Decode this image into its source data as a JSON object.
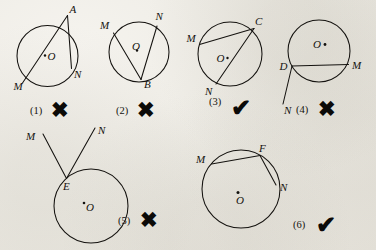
{
  "page": {
    "background_color": "#efece6",
    "ink_color": "#14120f",
    "figure_count": 6,
    "rows": 2
  },
  "marks": {
    "cross_glyph": "✖",
    "check_glyph": "✔",
    "cross_name": "cross-mark",
    "check_name": "check-mark"
  },
  "figures": [
    {
      "id": "fig-1",
      "number": "(1)",
      "verdict": "cross",
      "verdict_glyph": "✖",
      "center_label": "O",
      "point_labels": [
        "A",
        "M",
        "N"
      ],
      "description": "Vertex A outside the circle with two lines cutting the circle"
    },
    {
      "id": "fig-2",
      "number": "(2)",
      "verdict": "cross",
      "verdict_glyph": "✖",
      "center_label": "O",
      "point_labels": [
        "M",
        "N",
        "B"
      ],
      "description": "Vertex B on circle, chords BM and BN, center O marked"
    },
    {
      "id": "fig-3",
      "number": "(3)",
      "verdict": "check",
      "verdict_glyph": "✔",
      "center_label": "O",
      "point_labels": [
        "C",
        "M",
        "N"
      ],
      "description": "Vertex C on circle with two chords CM and CN"
    },
    {
      "id": "fig-4",
      "number": "(4)",
      "verdict": "cross",
      "verdict_glyph": "✖",
      "center_label": "O",
      "point_labels": [
        "D",
        "M",
        "N"
      ],
      "description": "Chord DM with ray DN extending outside the circle"
    },
    {
      "id": "fig-5",
      "number": "(5)",
      "verdict": "cross",
      "verdict_glyph": "✖",
      "center_label": "O",
      "point_labels": [
        "M",
        "N",
        "E"
      ],
      "description": "Vertex E on circle but both rays EM and EN lie outside the circle"
    },
    {
      "id": "fig-6",
      "number": "(6)",
      "verdict": "check",
      "verdict_glyph": "✔",
      "center_label": "O",
      "point_labels": [
        "M",
        "F",
        "N"
      ],
      "description": "Vertex F on circle with two chords FM and FN"
    }
  ]
}
